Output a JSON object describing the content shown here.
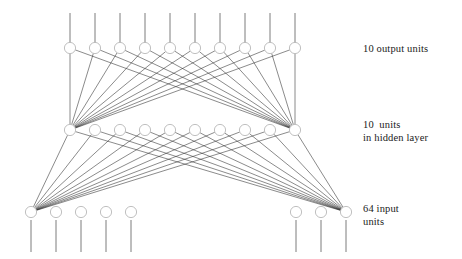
{
  "diagram": {
    "type": "feedforward-neural-network",
    "background_color": "#ffffff",
    "node_stroke_color": "#b9b9b9",
    "edge_color": "#2b2b2b",
    "stub_color": "#6e6e6e",
    "text_color": "#1a1a1a",
    "node_radius": 5.6,
    "width": 462,
    "height": 259
  },
  "labels": {
    "output": {
      "lines": [
        "10 output units"
      ],
      "x": 363,
      "y": 43
    },
    "hidden": {
      "lines": [
        "10  units",
        "in hidden layer"
      ],
      "x": 363,
      "y": 119
    },
    "input": {
      "lines": [
        "64 input",
        "units"
      ],
      "x": 363,
      "y": 203
    }
  },
  "layers": [
    {
      "name": "output-layer",
      "role": "output",
      "unit_count": 10,
      "drawn_node_count": 10,
      "y": 48,
      "x_positions": [
        70,
        95,
        120,
        145,
        170,
        195,
        220,
        245,
        270,
        295
      ],
      "stub": {
        "direction": "up",
        "from_y": 13,
        "to_y": 43
      }
    },
    {
      "name": "hidden-layer",
      "role": "hidden",
      "unit_count": 10,
      "drawn_node_count": 10,
      "y": 130,
      "x_positions": [
        70,
        95,
        120,
        145,
        170,
        195,
        220,
        245,
        270,
        295
      ],
      "stub": null
    },
    {
      "name": "input-layer",
      "role": "input",
      "unit_count": 64,
      "drawn_node_count": 8,
      "y": 212,
      "x_positions": [
        31,
        56,
        81,
        106,
        131,
        296,
        321,
        346
      ],
      "stub": {
        "direction": "down",
        "from_y": 220,
        "to_y": 252
      }
    }
  ],
  "connections": [
    {
      "name": "hidden-to-output",
      "from_layer": "hidden-layer",
      "to_layer": "output-layer",
      "fan_sources_x": [
        70,
        295
      ],
      "fan_source_y": 130,
      "targets_x": [
        70,
        95,
        120,
        145,
        170,
        195,
        220,
        245,
        270,
        295
      ],
      "target_y": 48
    },
    {
      "name": "input-to-hidden",
      "from_layer": "input-layer",
      "to_layer": "hidden-layer",
      "fan_sources_x": [
        31,
        346
      ],
      "fan_source_y": 212,
      "targets_x": [
        70,
        95,
        120,
        145,
        170,
        195,
        220,
        245,
        270,
        295
      ],
      "target_y": 130
    }
  ]
}
